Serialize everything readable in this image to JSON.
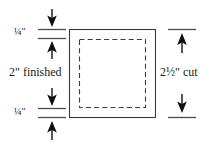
{
  "figure": {
    "background_color": "#ffffff",
    "ink_color": "#1a1a1a"
  },
  "labels": {
    "quarter_top": "¼\"",
    "quarter_bottom": "¼\"",
    "finished": "2\" finished",
    "cut": "2½\" cut"
  },
  "annotations": {
    "seam_allowance_top": "¼\"",
    "seam_allowance_bottom": "¼\"",
    "finished_size": "2\"",
    "cut_size": "2½\""
  },
  "shapes": {
    "outer_square_label": "cut square",
    "inner_square_label": "finished square",
    "outer_square_style": "solid",
    "inner_square_style": "dashed"
  },
  "arrows": {
    "top_left_down": "arrow-down",
    "top_left_up": "arrow-up",
    "bottom_left_down": "arrow-down",
    "bottom_left_up": "arrow-up",
    "right_top_up": "arrow-up",
    "right_bottom_down": "arrow-down"
  }
}
